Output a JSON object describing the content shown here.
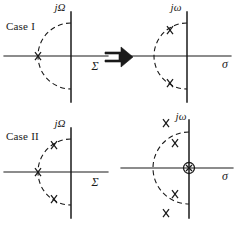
{
  "figure": {
    "background_color": "#ffffff",
    "ink_color": "#1a1a1a",
    "width": 238,
    "height": 225
  },
  "rows": [
    {
      "id": "case-1",
      "label": "Case I",
      "arrow_glyph": "double-right-arrow",
      "left_plot": {
        "name": "case-1-source-plane",
        "vertical_axis_label": "jΩ",
        "horizontal_axis_label": "Σ",
        "arc": {
          "style": "dashed",
          "shape": "left-semicircle",
          "radius_px": 33
        },
        "poles": [
          {
            "marker": "x",
            "position": "negative-real-axis",
            "x": -33,
            "y": 0
          }
        ]
      },
      "right_plot": {
        "name": "case-1-target-plane",
        "vertical_axis_label": "jω",
        "horizontal_axis_label": "σ",
        "arc": {
          "style": "dashed",
          "shape": "left-semicircle",
          "radius_px": 33
        },
        "poles": [
          {
            "marker": "x",
            "position": "upper-left-arc",
            "x": -17,
            "y": 28
          },
          {
            "marker": "x",
            "position": "lower-left-arc",
            "x": -17,
            "y": -28
          }
        ]
      }
    },
    {
      "id": "case-2",
      "label": "Case II",
      "arrow_glyph": "double-right-arrow",
      "left_plot": {
        "name": "case-2-source-plane",
        "vertical_axis_label": "jΩ",
        "horizontal_axis_label": "Σ",
        "arc": {
          "style": "dashed",
          "shape": "left-semicircle",
          "radius_px": 33
        },
        "poles": [
          {
            "marker": "x",
            "position": "upper-left-arc",
            "x": -17,
            "y": 28
          },
          {
            "marker": "x",
            "position": "negative-real-axis",
            "x": -33,
            "y": 0
          },
          {
            "marker": "x",
            "position": "lower-left-arc",
            "x": -17,
            "y": -28
          }
        ]
      },
      "right_plot": {
        "name": "case-2-target-plane",
        "vertical_axis_label": "jω",
        "horizontal_axis_label": "σ",
        "arc": {
          "style": "dashed",
          "shape": "left-semicircle",
          "radius_px": 36
        },
        "poles": [
          {
            "marker": "x",
            "position": "upper-outer",
            "x": -14,
            "y": 46
          },
          {
            "marker": "x",
            "position": "upper-inner",
            "x": -10,
            "y": 24
          },
          {
            "marker": "x-circled",
            "position": "origin",
            "x": 0,
            "y": 0
          },
          {
            "marker": "x",
            "position": "lower-inner",
            "x": -10,
            "y": -24
          },
          {
            "marker": "x",
            "position": "lower-outer",
            "x": -14,
            "y": -46
          }
        ]
      }
    }
  ]
}
